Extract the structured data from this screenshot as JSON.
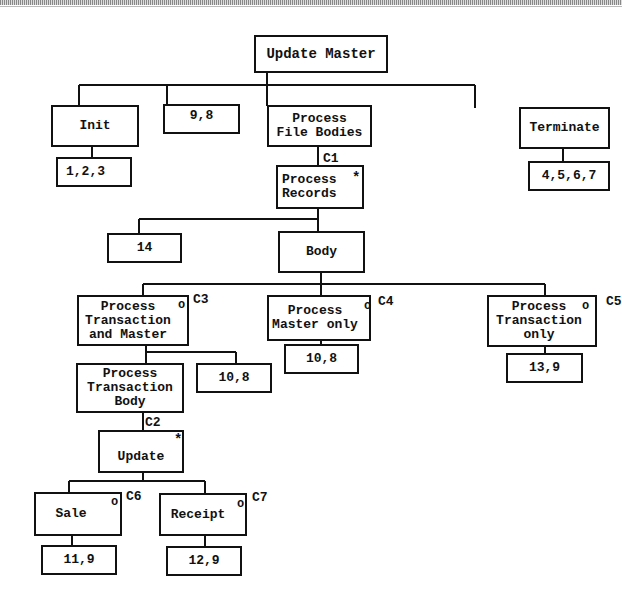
{
  "diagram": {
    "type": "jackson-structure-chart",
    "nodes": {
      "update_master": {
        "label": "Update Master"
      },
      "init": {
        "label": "Init"
      },
      "ops_98_top": {
        "label": "9,8"
      },
      "process_file_bodies": {
        "label": "Process\nFile Bodies"
      },
      "terminate": {
        "label": "Terminate"
      },
      "ops_123": {
        "label": "1,2,3"
      },
      "ops_4567": {
        "label": "4,5,6,7"
      },
      "process_records": {
        "label": "Process\nRecords",
        "marker": "*"
      },
      "ops_14": {
        "label": "14"
      },
      "body": {
        "label": "Body"
      },
      "process_txn_and_master": {
        "label": "Process\nTransaction\nand Master",
        "marker": "o"
      },
      "process_master_only": {
        "label": "Process\nMaster only",
        "marker": "o"
      },
      "process_txn_only": {
        "label": "Process\nTransaction\nonly",
        "marker": "o"
      },
      "ops_108_master": {
        "label": "10,8"
      },
      "ops_108_txn": {
        "label": "10,8"
      },
      "ops_139": {
        "label": "13,9"
      },
      "process_txn_body": {
        "label": "Process\nTransaction\nBody"
      },
      "update": {
        "label": "Update",
        "marker": "*"
      },
      "sale": {
        "label": "Sale",
        "marker": "o"
      },
      "receipt": {
        "label": "Receipt",
        "marker": "o"
      },
      "ops_119": {
        "label": "11,9"
      },
      "ops_129": {
        "label": "12,9"
      }
    },
    "conditions": {
      "c1": "C1",
      "c2": "C2",
      "c3": "C3",
      "c4": "C4",
      "c5": "C5",
      "c6": "C6",
      "c7": "C7"
    }
  }
}
